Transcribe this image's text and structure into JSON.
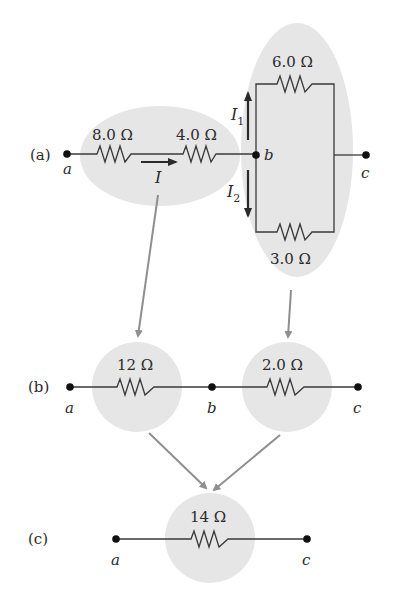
{
  "diagram": {
    "colors": {
      "wire": "#3a3a3a",
      "resistor": "#4a4a4a",
      "node": "#111111",
      "shade": "#e6e6e6",
      "reduction_arrow": "#8f8f8f",
      "current_arrow": "#2a2a2a"
    },
    "panel_a": {
      "label": "(a)",
      "nodes": {
        "a": "a",
        "b": "b",
        "c": "c"
      },
      "resistors": {
        "r1": "8.0 Ω",
        "r2": "4.0 Ω",
        "r3_top": "6.0 Ω",
        "r4_bottom": "3.0 Ω"
      },
      "currents": {
        "I": "I",
        "I1_main": "I",
        "I1_sub": "1",
        "I2_main": "I",
        "I2_sub": "2"
      }
    },
    "panel_b": {
      "label": "(b)",
      "nodes": {
        "a": "a",
        "b": "b",
        "c": "c"
      },
      "resistors": {
        "series_equiv": "12 Ω",
        "parallel_equiv": "2.0 Ω"
      }
    },
    "panel_c": {
      "label": "(c)",
      "nodes": {
        "a": "a",
        "c": "c"
      },
      "resistors": {
        "total_equiv": "14 Ω"
      }
    }
  }
}
